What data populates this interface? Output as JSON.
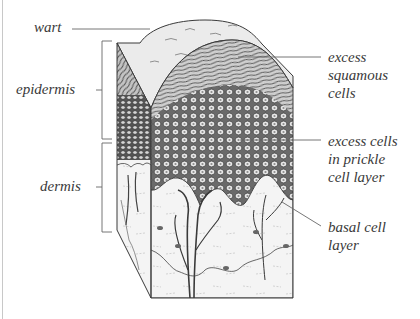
{
  "diagram": {
    "title": "",
    "labels": {
      "wart": "wart",
      "epidermis": "epidermis",
      "dermis": "dermis",
      "excess_squamous": "excess\nsquamous\ncells",
      "excess_prickle": "excess cells\nin prickle\ncell layer",
      "basal": "basal cell\nlayer"
    },
    "colors": {
      "ink": "#3a3a3a",
      "line": "#555555",
      "border": "#c8c8c8",
      "background": "#ffffff"
    }
  }
}
